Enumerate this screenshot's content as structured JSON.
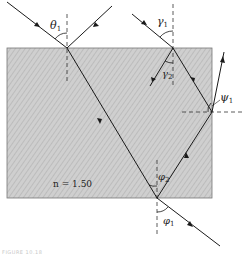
{
  "figure": {
    "medium_label": "n = 1.50",
    "angles": {
      "theta1": {
        "symbol": "θ",
        "sub": "1"
      },
      "gamma1": {
        "symbol": "γ",
        "sub": "1"
      },
      "gamma2": {
        "symbol": "γ",
        "sub": "2"
      },
      "psi1": {
        "symbol": "ψ",
        "sub": "1"
      },
      "phi2": {
        "symbol": "φ",
        "sub": "2"
      },
      "phi1": {
        "symbol": "φ",
        "sub": "1"
      }
    },
    "caption": "FIGURE 10.18",
    "colors": {
      "block_fill": "#c9c9c9",
      "block_edge": "#555555",
      "ray": "#1a1a1a",
      "normal": "#333333"
    }
  }
}
